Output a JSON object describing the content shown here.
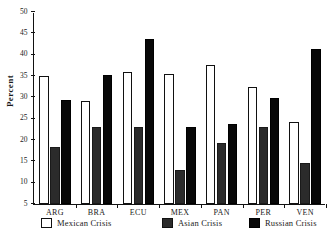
{
  "chart_data": {
    "type": "bar",
    "title": "",
    "xlabel": "",
    "ylabel": "Percent",
    "ylim": [
      5,
      50
    ],
    "ytick_values": [
      5,
      10,
      15,
      20,
      25,
      30,
      35,
      40,
      45,
      50
    ],
    "ytick_labels": [
      "5",
      "10",
      "15",
      "20",
      "25",
      "30",
      "35",
      "40",
      "45",
      "50"
    ],
    "grid": false,
    "legend_position": "bottom",
    "categories": [
      "ARG",
      "BRA",
      "ECU",
      "MEX",
      "PAN",
      "PER",
      "VEN"
    ],
    "series": [
      {
        "name": "Mexican Crisis",
        "color": "#ffffff",
        "values": [
          35.0,
          29.2,
          36.0,
          35.4,
          37.6,
          32.4,
          24.3
        ]
      },
      {
        "name": "Asian Crisis",
        "color": "#2b2b2b",
        "values": [
          18.3,
          23.0,
          23.0,
          13.0,
          19.3,
          23.0,
          14.7
        ]
      },
      {
        "name": "Russian Crisis",
        "color": "#080808",
        "values": [
          29.3,
          35.2,
          43.7,
          23.0,
          23.7,
          29.8,
          41.3
        ]
      }
    ]
  },
  "legend": {
    "items": [
      {
        "label": "Mexican Crisis",
        "swatch": "mexican-crisis-swatch"
      },
      {
        "label": "Asian Crisis",
        "swatch": "asian-crisis-swatch"
      },
      {
        "label": "Russian Crisis",
        "swatch": "russian-crisis-swatch"
      }
    ]
  }
}
